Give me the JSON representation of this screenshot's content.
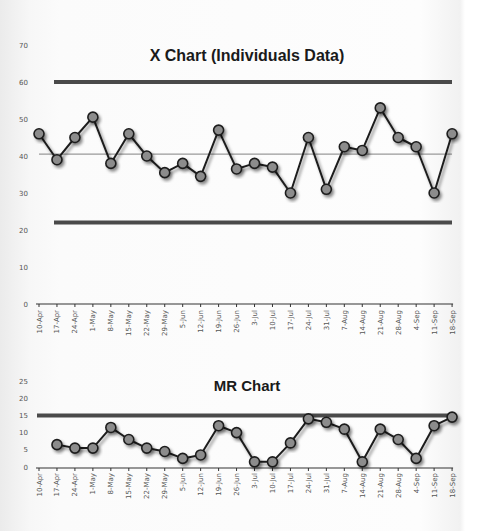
{
  "chart_data": [
    {
      "type": "line",
      "title": "X Chart (Individuals Data)",
      "xlabel": "",
      "ylabel": "",
      "ylim": [
        0,
        70
      ],
      "yticks": [
        0,
        10,
        20,
        30,
        40,
        50,
        60,
        70
      ],
      "grid": false,
      "legend": "none",
      "categories": [
        "10-Apr",
        "17-Apr",
        "24-Apr",
        "1-May",
        "8-May",
        "15-May",
        "22-May",
        "29-May",
        "5-Jun",
        "12-Jun",
        "19-Jun",
        "26-Jun",
        "3-Jul",
        "10-Jul",
        "17-Jul",
        "24-Jul",
        "31-Jul",
        "7-Aug",
        "14-Aug",
        "21-Aug",
        "28-Aug",
        "4-Sep",
        "11-Sep",
        "18-Sep"
      ],
      "series": [
        {
          "name": "Individual values",
          "values": [
            46,
            39,
            45,
            50.5,
            38,
            46,
            40,
            35.5,
            38,
            34.5,
            47,
            36.5,
            38,
            37,
            30,
            45,
            31,
            42.5,
            41.5,
            53,
            45,
            42.5,
            30,
            46
          ]
        }
      ],
      "control_limits": {
        "UCL": 60,
        "CL": 40.5,
        "LCL": 22
      }
    },
    {
      "type": "line",
      "title": "MR Chart",
      "xlabel": "",
      "ylabel": "",
      "ylim": [
        0,
        25
      ],
      "yticks": [
        0,
        5,
        10,
        15,
        20,
        25
      ],
      "grid": false,
      "legend": "none",
      "categories": [
        "10-Apr",
        "17-Apr",
        "24-Apr",
        "1-May",
        "8-May",
        "15-May",
        "22-May",
        "29-May",
        "5-Jun",
        "12-Jun",
        "19-Jun",
        "26-Jun",
        "3-Jul",
        "10-Jul",
        "17-Jul",
        "24-Jul",
        "31-Jul",
        "7-Aug",
        "14-Aug",
        "21-Aug",
        "28-Aug",
        "4-Sep",
        "11-Sep",
        "18-Sep"
      ],
      "series": [
        {
          "name": "Moving range",
          "values": [
            null,
            6.5,
            5.5,
            5.5,
            11.5,
            8,
            5.5,
            4.5,
            2.5,
            3.5,
            12,
            10,
            1.5,
            1.5,
            7,
            14,
            13,
            11,
            1.5,
            11,
            8,
            2.5,
            12,
            14.5
          ]
        }
      ],
      "control_limits": {
        "UCL": 15
      }
    }
  ],
  "colors": {
    "line": "#1e1e1e",
    "marker_fill": "#8c8c8c",
    "limit_line": "#4a4a4a",
    "center_line": "#9a9a9a"
  }
}
